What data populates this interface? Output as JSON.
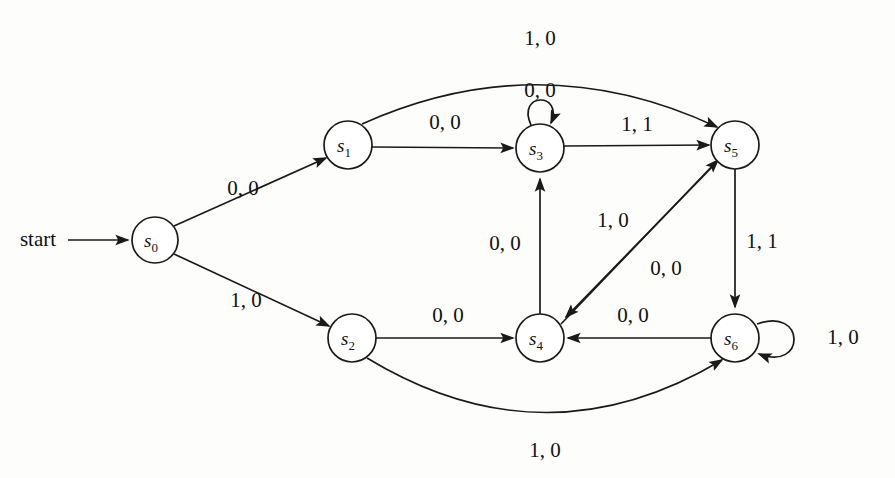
{
  "diagram": {
    "type": "finite-state-machine",
    "kind": "mealy-machine",
    "start_label": "start",
    "states": [
      {
        "id": "s0",
        "name": "s",
        "sub": "0",
        "cx": 155,
        "cy": 240,
        "r": 23
      },
      {
        "id": "s1",
        "name": "s",
        "sub": "1",
        "cx": 348,
        "cy": 145,
        "r": 24
      },
      {
        "id": "s2",
        "name": "s",
        "sub": "2",
        "cx": 352,
        "cy": 338,
        "r": 24
      },
      {
        "id": "s3",
        "name": "s",
        "sub": "3",
        "cx": 540,
        "cy": 148,
        "r": 24
      },
      {
        "id": "s4",
        "name": "s",
        "sub": "4",
        "cx": 540,
        "cy": 338,
        "r": 24
      },
      {
        "id": "s5",
        "name": "s",
        "sub": "5",
        "cx": 735,
        "cy": 145,
        "r": 24
      },
      {
        "id": "s6",
        "name": "s",
        "sub": "6",
        "cx": 735,
        "cy": 338,
        "r": 24
      }
    ],
    "transitions": [
      {
        "id": "t-s0-s1",
        "from": "s0",
        "to": "s1",
        "input": "0",
        "output": "0",
        "label": "0, 0",
        "label_x": 243,
        "label_y": 190
      },
      {
        "id": "t-s0-s2",
        "from": "s0",
        "to": "s2",
        "input": "1",
        "output": "0",
        "label": "1, 0",
        "label_x": 246,
        "label_y": 302
      },
      {
        "id": "t-s1-s3",
        "from": "s1",
        "to": "s3",
        "input": "0",
        "output": "0",
        "label": "0, 0",
        "label_x": 445,
        "label_y": 124
      },
      {
        "id": "t-s1-s5",
        "from": "s1",
        "to": "s5",
        "input": "1",
        "output": "0",
        "label": "1, 0",
        "label_x": 540,
        "label_y": 40
      },
      {
        "id": "t-s2-s4",
        "from": "s2",
        "to": "s4",
        "input": "0",
        "output": "0",
        "label": "0, 0",
        "label_x": 448,
        "label_y": 317
      },
      {
        "id": "t-s2-s6",
        "from": "s2",
        "to": "s6",
        "input": "1",
        "output": "0",
        "label": "1, 0",
        "label_x": 545,
        "label_y": 452
      },
      {
        "id": "t-s3-s3",
        "from": "s3",
        "to": "s3",
        "input": "0",
        "output": "0",
        "label": "0, 0",
        "label_x": 540,
        "label_y": 92
      },
      {
        "id": "t-s3-s5",
        "from": "s3",
        "to": "s5",
        "input": "1",
        "output": "1",
        "label": "1, 1",
        "label_x": 637,
        "label_y": 126
      },
      {
        "id": "t-s4-s3",
        "from": "s4",
        "to": "s3",
        "input": "0",
        "output": "0",
        "label": "0, 0",
        "label_x": 505,
        "label_y": 245
      },
      {
        "id": "t-s4-s5",
        "from": "s4",
        "to": "s5",
        "input": "0",
        "output": "0",
        "label": "0, 0",
        "label_x": 666,
        "label_y": 270
      },
      {
        "id": "t-s5-s4",
        "from": "s5",
        "to": "s4",
        "input": "1",
        "output": "0",
        "label": "1, 0",
        "label_x": 613,
        "label_y": 222
      },
      {
        "id": "t-s5-s6",
        "from": "s5",
        "to": "s6",
        "input": "1",
        "output": "1",
        "label": "1, 1",
        "label_x": 762,
        "label_y": 243
      },
      {
        "id": "t-s6-s4",
        "from": "s6",
        "to": "s4",
        "input": "0",
        "output": "0",
        "label": "0, 0",
        "label_x": 633,
        "label_y": 317
      },
      {
        "id": "t-s6-s6",
        "from": "s6",
        "to": "s6",
        "input": "1",
        "output": "0",
        "label": "1, 0",
        "label_x": 843,
        "label_y": 339
      }
    ]
  }
}
